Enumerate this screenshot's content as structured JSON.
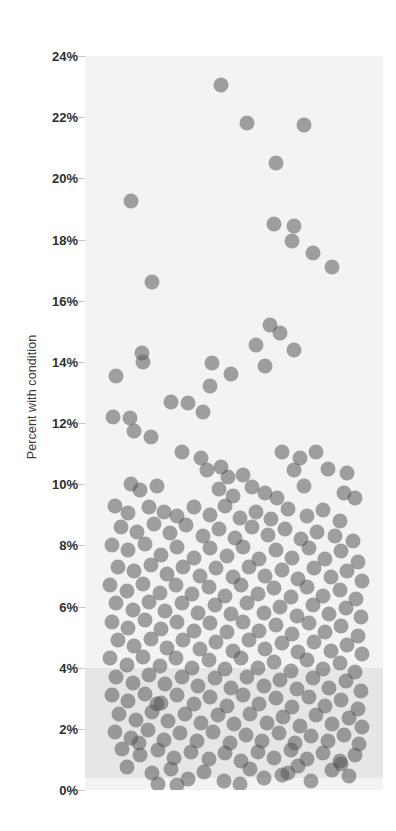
{
  "chart_data": {
    "type": "scatter",
    "title": "",
    "xlabel": "",
    "ylabel": "Percent with condition",
    "ylim": [
      0,
      24
    ],
    "xlim": [
      0,
      1
    ],
    "grid": false,
    "legend": null,
    "y_tick_labels": [
      "24%",
      "22%",
      "20%",
      "18%",
      "16%",
      "14%",
      "12%",
      "10%",
      "8%",
      "6%",
      "4%",
      "2%",
      "0%"
    ],
    "y_tick_values": [
      24,
      22,
      20,
      18,
      16,
      14,
      12,
      10,
      8,
      6,
      4,
      2,
      0
    ],
    "x_tick_labels": [],
    "marker": {
      "shape": "circle",
      "diameter_px": 15,
      "color": "#585858",
      "opacity": 0.55
    },
    "plot_background": "#f3f3f3",
    "shaded_band": {
      "color": "#e6e6e6",
      "y_from": 0.4,
      "y_to": 4.0
    },
    "points": [
      {
        "x": 0.455,
        "y": 23.05
      },
      {
        "x": 0.545,
        "y": 21.8
      },
      {
        "x": 0.735,
        "y": 21.75
      },
      {
        "x": 0.64,
        "y": 20.5
      },
      {
        "x": 0.155,
        "y": 19.25
      },
      {
        "x": 0.635,
        "y": 18.5
      },
      {
        "x": 0.7,
        "y": 18.45
      },
      {
        "x": 0.695,
        "y": 17.95
      },
      {
        "x": 0.765,
        "y": 17.55
      },
      {
        "x": 0.83,
        "y": 17.1
      },
      {
        "x": 0.225,
        "y": 16.6
      },
      {
        "x": 0.62,
        "y": 15.2
      },
      {
        "x": 0.655,
        "y": 14.95
      },
      {
        "x": 0.575,
        "y": 14.55
      },
      {
        "x": 0.7,
        "y": 14.4
      },
      {
        "x": 0.19,
        "y": 14.3
      },
      {
        "x": 0.195,
        "y": 14.0
      },
      {
        "x": 0.425,
        "y": 13.95
      },
      {
        "x": 0.49,
        "y": 13.6
      },
      {
        "x": 0.605,
        "y": 13.85
      },
      {
        "x": 0.105,
        "y": 13.55
      },
      {
        "x": 0.42,
        "y": 13.2
      },
      {
        "x": 0.29,
        "y": 12.7
      },
      {
        "x": 0.345,
        "y": 12.65
      },
      {
        "x": 0.395,
        "y": 12.35
      },
      {
        "x": 0.095,
        "y": 12.2
      },
      {
        "x": 0.15,
        "y": 12.15
      },
      {
        "x": 0.165,
        "y": 11.75
      },
      {
        "x": 0.22,
        "y": 11.55
      },
      {
        "x": 0.325,
        "y": 11.05
      },
      {
        "x": 0.39,
        "y": 10.85
      },
      {
        "x": 0.66,
        "y": 11.05
      },
      {
        "x": 0.72,
        "y": 10.85
      },
      {
        "x": 0.775,
        "y": 11.05
      },
      {
        "x": 0.41,
        "y": 10.45
      },
      {
        "x": 0.455,
        "y": 10.55
      },
      {
        "x": 0.48,
        "y": 10.25
      },
      {
        "x": 0.53,
        "y": 10.3
      },
      {
        "x": 0.7,
        "y": 10.45
      },
      {
        "x": 0.815,
        "y": 10.5
      },
      {
        "x": 0.88,
        "y": 10.35
      },
      {
        "x": 0.155,
        "y": 10.0
      },
      {
        "x": 0.185,
        "y": 9.8
      },
      {
        "x": 0.24,
        "y": 9.95
      },
      {
        "x": 0.45,
        "y": 9.85
      },
      {
        "x": 0.495,
        "y": 9.6
      },
      {
        "x": 0.56,
        "y": 9.9
      },
      {
        "x": 0.605,
        "y": 9.7
      },
      {
        "x": 0.645,
        "y": 9.55
      },
      {
        "x": 0.735,
        "y": 9.95
      },
      {
        "x": 0.87,
        "y": 9.7
      },
      {
        "x": 0.905,
        "y": 9.55
      },
      {
        "x": 0.1,
        "y": 9.3
      },
      {
        "x": 0.145,
        "y": 9.05
      },
      {
        "x": 0.215,
        "y": 9.25
      },
      {
        "x": 0.265,
        "y": 9.1
      },
      {
        "x": 0.31,
        "y": 8.95
      },
      {
        "x": 0.365,
        "y": 9.25
      },
      {
        "x": 0.42,
        "y": 9.0
      },
      {
        "x": 0.47,
        "y": 9.3
      },
      {
        "x": 0.52,
        "y": 8.9
      },
      {
        "x": 0.575,
        "y": 9.1
      },
      {
        "x": 0.625,
        "y": 8.85
      },
      {
        "x": 0.68,
        "y": 9.2
      },
      {
        "x": 0.745,
        "y": 8.95
      },
      {
        "x": 0.8,
        "y": 9.15
      },
      {
        "x": 0.855,
        "y": 8.8
      },
      {
        "x": 0.12,
        "y": 8.6
      },
      {
        "x": 0.175,
        "y": 8.45
      },
      {
        "x": 0.23,
        "y": 8.7
      },
      {
        "x": 0.285,
        "y": 8.4
      },
      {
        "x": 0.34,
        "y": 8.65
      },
      {
        "x": 0.395,
        "y": 8.3
      },
      {
        "x": 0.45,
        "y": 8.55
      },
      {
        "x": 0.505,
        "y": 8.25
      },
      {
        "x": 0.56,
        "y": 8.6
      },
      {
        "x": 0.615,
        "y": 8.35
      },
      {
        "x": 0.67,
        "y": 8.55
      },
      {
        "x": 0.725,
        "y": 8.2
      },
      {
        "x": 0.78,
        "y": 8.45
      },
      {
        "x": 0.84,
        "y": 8.3
      },
      {
        "x": 0.9,
        "y": 8.15
      },
      {
        "x": 0.09,
        "y": 8.0
      },
      {
        "x": 0.145,
        "y": 7.85
      },
      {
        "x": 0.2,
        "y": 8.05
      },
      {
        "x": 0.255,
        "y": 7.7
      },
      {
        "x": 0.31,
        "y": 7.95
      },
      {
        "x": 0.365,
        "y": 7.6
      },
      {
        "x": 0.42,
        "y": 7.9
      },
      {
        "x": 0.475,
        "y": 7.65
      },
      {
        "x": 0.53,
        "y": 7.95
      },
      {
        "x": 0.585,
        "y": 7.55
      },
      {
        "x": 0.64,
        "y": 7.85
      },
      {
        "x": 0.695,
        "y": 7.6
      },
      {
        "x": 0.75,
        "y": 7.9
      },
      {
        "x": 0.805,
        "y": 7.55
      },
      {
        "x": 0.86,
        "y": 7.8
      },
      {
        "x": 0.915,
        "y": 7.45
      },
      {
        "x": 0.11,
        "y": 7.3
      },
      {
        "x": 0.165,
        "y": 7.15
      },
      {
        "x": 0.22,
        "y": 7.35
      },
      {
        "x": 0.275,
        "y": 7.05
      },
      {
        "x": 0.33,
        "y": 7.3
      },
      {
        "x": 0.385,
        "y": 7.0
      },
      {
        "x": 0.44,
        "y": 7.25
      },
      {
        "x": 0.495,
        "y": 6.95
      },
      {
        "x": 0.55,
        "y": 7.3
      },
      {
        "x": 0.605,
        "y": 7.0
      },
      {
        "x": 0.66,
        "y": 7.2
      },
      {
        "x": 0.715,
        "y": 6.9
      },
      {
        "x": 0.77,
        "y": 7.25
      },
      {
        "x": 0.825,
        "y": 6.95
      },
      {
        "x": 0.88,
        "y": 7.15
      },
      {
        "x": 0.93,
        "y": 6.85
      },
      {
        "x": 0.085,
        "y": 6.7
      },
      {
        "x": 0.14,
        "y": 6.5
      },
      {
        "x": 0.195,
        "y": 6.75
      },
      {
        "x": 0.25,
        "y": 6.45
      },
      {
        "x": 0.305,
        "y": 6.7
      },
      {
        "x": 0.36,
        "y": 6.4
      },
      {
        "x": 0.415,
        "y": 6.65
      },
      {
        "x": 0.47,
        "y": 6.35
      },
      {
        "x": 0.525,
        "y": 6.7
      },
      {
        "x": 0.58,
        "y": 6.4
      },
      {
        "x": 0.635,
        "y": 6.6
      },
      {
        "x": 0.69,
        "y": 6.3
      },
      {
        "x": 0.745,
        "y": 6.65
      },
      {
        "x": 0.8,
        "y": 6.35
      },
      {
        "x": 0.855,
        "y": 6.55
      },
      {
        "x": 0.91,
        "y": 6.25
      },
      {
        "x": 0.105,
        "y": 6.1
      },
      {
        "x": 0.16,
        "y": 5.9
      },
      {
        "x": 0.215,
        "y": 6.15
      },
      {
        "x": 0.27,
        "y": 5.85
      },
      {
        "x": 0.325,
        "y": 6.1
      },
      {
        "x": 0.38,
        "y": 5.8
      },
      {
        "x": 0.435,
        "y": 6.05
      },
      {
        "x": 0.49,
        "y": 5.75
      },
      {
        "x": 0.545,
        "y": 6.1
      },
      {
        "x": 0.6,
        "y": 5.8
      },
      {
        "x": 0.655,
        "y": 6.0
      },
      {
        "x": 0.71,
        "y": 5.7
      },
      {
        "x": 0.765,
        "y": 6.05
      },
      {
        "x": 0.82,
        "y": 5.75
      },
      {
        "x": 0.875,
        "y": 5.95
      },
      {
        "x": 0.925,
        "y": 5.65
      },
      {
        "x": 0.09,
        "y": 5.5
      },
      {
        "x": 0.145,
        "y": 5.3
      },
      {
        "x": 0.2,
        "y": 5.55
      },
      {
        "x": 0.255,
        "y": 5.25
      },
      {
        "x": 0.31,
        "y": 5.5
      },
      {
        "x": 0.365,
        "y": 5.2
      },
      {
        "x": 0.42,
        "y": 5.45
      },
      {
        "x": 0.475,
        "y": 5.15
      },
      {
        "x": 0.53,
        "y": 5.5
      },
      {
        "x": 0.585,
        "y": 5.2
      },
      {
        "x": 0.64,
        "y": 5.4
      },
      {
        "x": 0.695,
        "y": 5.1
      },
      {
        "x": 0.75,
        "y": 5.45
      },
      {
        "x": 0.805,
        "y": 5.15
      },
      {
        "x": 0.86,
        "y": 5.35
      },
      {
        "x": 0.915,
        "y": 5.05
      },
      {
        "x": 0.11,
        "y": 4.9
      },
      {
        "x": 0.165,
        "y": 4.7
      },
      {
        "x": 0.22,
        "y": 4.95
      },
      {
        "x": 0.275,
        "y": 4.65
      },
      {
        "x": 0.33,
        "y": 4.9
      },
      {
        "x": 0.385,
        "y": 4.6
      },
      {
        "x": 0.44,
        "y": 4.85
      },
      {
        "x": 0.495,
        "y": 4.55
      },
      {
        "x": 0.55,
        "y": 4.9
      },
      {
        "x": 0.605,
        "y": 4.6
      },
      {
        "x": 0.66,
        "y": 4.8
      },
      {
        "x": 0.715,
        "y": 4.5
      },
      {
        "x": 0.77,
        "y": 4.85
      },
      {
        "x": 0.825,
        "y": 4.55
      },
      {
        "x": 0.88,
        "y": 4.75
      },
      {
        "x": 0.93,
        "y": 4.45
      },
      {
        "x": 0.085,
        "y": 4.3
      },
      {
        "x": 0.14,
        "y": 4.1
      },
      {
        "x": 0.195,
        "y": 4.35
      },
      {
        "x": 0.25,
        "y": 4.05
      },
      {
        "x": 0.305,
        "y": 4.3
      },
      {
        "x": 0.36,
        "y": 4.0
      },
      {
        "x": 0.415,
        "y": 4.25
      },
      {
        "x": 0.47,
        "y": 3.95
      },
      {
        "x": 0.525,
        "y": 4.3
      },
      {
        "x": 0.58,
        "y": 4.0
      },
      {
        "x": 0.635,
        "y": 4.2
      },
      {
        "x": 0.69,
        "y": 3.9
      },
      {
        "x": 0.745,
        "y": 4.25
      },
      {
        "x": 0.8,
        "y": 3.95
      },
      {
        "x": 0.855,
        "y": 4.15
      },
      {
        "x": 0.905,
        "y": 3.85
      },
      {
        "x": 0.105,
        "y": 3.7
      },
      {
        "x": 0.16,
        "y": 3.5
      },
      {
        "x": 0.215,
        "y": 3.75
      },
      {
        "x": 0.27,
        "y": 3.45
      },
      {
        "x": 0.325,
        "y": 3.7
      },
      {
        "x": 0.38,
        "y": 3.4
      },
      {
        "x": 0.435,
        "y": 3.65
      },
      {
        "x": 0.49,
        "y": 3.35
      },
      {
        "x": 0.545,
        "y": 3.7
      },
      {
        "x": 0.6,
        "y": 3.4
      },
      {
        "x": 0.655,
        "y": 3.6
      },
      {
        "x": 0.71,
        "y": 3.3
      },
      {
        "x": 0.765,
        "y": 3.65
      },
      {
        "x": 0.82,
        "y": 3.35
      },
      {
        "x": 0.875,
        "y": 3.55
      },
      {
        "x": 0.925,
        "y": 3.25
      },
      {
        "x": 0.09,
        "y": 3.1
      },
      {
        "x": 0.145,
        "y": 2.9
      },
      {
        "x": 0.2,
        "y": 3.15
      },
      {
        "x": 0.255,
        "y": 2.85
      },
      {
        "x": 0.31,
        "y": 3.1
      },
      {
        "x": 0.365,
        "y": 2.8
      },
      {
        "x": 0.42,
        "y": 3.05
      },
      {
        "x": 0.475,
        "y": 2.75
      },
      {
        "x": 0.53,
        "y": 3.1
      },
      {
        "x": 0.585,
        "y": 2.8
      },
      {
        "x": 0.64,
        "y": 3.0
      },
      {
        "x": 0.695,
        "y": 2.7
      },
      {
        "x": 0.75,
        "y": 3.05
      },
      {
        "x": 0.805,
        "y": 2.75
      },
      {
        "x": 0.86,
        "y": 2.95
      },
      {
        "x": 0.915,
        "y": 2.65
      },
      {
        "x": 0.115,
        "y": 2.5
      },
      {
        "x": 0.17,
        "y": 2.3
      },
      {
        "x": 0.225,
        "y": 2.55
      },
      {
        "x": 0.28,
        "y": 2.25
      },
      {
        "x": 0.335,
        "y": 2.5
      },
      {
        "x": 0.39,
        "y": 2.2
      },
      {
        "x": 0.445,
        "y": 2.45
      },
      {
        "x": 0.5,
        "y": 2.15
      },
      {
        "x": 0.555,
        "y": 2.5
      },
      {
        "x": 0.61,
        "y": 2.2
      },
      {
        "x": 0.665,
        "y": 2.4
      },
      {
        "x": 0.72,
        "y": 2.1
      },
      {
        "x": 0.775,
        "y": 2.45
      },
      {
        "x": 0.83,
        "y": 2.15
      },
      {
        "x": 0.885,
        "y": 2.35
      },
      {
        "x": 0.93,
        "y": 2.05
      },
      {
        "x": 0.1,
        "y": 1.9
      },
      {
        "x": 0.155,
        "y": 1.7
      },
      {
        "x": 0.21,
        "y": 1.95
      },
      {
        "x": 0.265,
        "y": 1.65
      },
      {
        "x": 0.32,
        "y": 1.85
      },
      {
        "x": 0.375,
        "y": 1.6
      },
      {
        "x": 0.43,
        "y": 1.9
      },
      {
        "x": 0.485,
        "y": 1.55
      },
      {
        "x": 0.54,
        "y": 1.8
      },
      {
        "x": 0.595,
        "y": 1.6
      },
      {
        "x": 0.65,
        "y": 1.85
      },
      {
        "x": 0.705,
        "y": 1.55
      },
      {
        "x": 0.76,
        "y": 1.75
      },
      {
        "x": 0.815,
        "y": 1.6
      },
      {
        "x": 0.87,
        "y": 1.8
      },
      {
        "x": 0.92,
        "y": 1.5
      },
      {
        "x": 0.125,
        "y": 1.35
      },
      {
        "x": 0.185,
        "y": 1.15
      },
      {
        "x": 0.245,
        "y": 1.3
      },
      {
        "x": 0.3,
        "y": 1.05
      },
      {
        "x": 0.355,
        "y": 1.25
      },
      {
        "x": 0.415,
        "y": 1.0
      },
      {
        "x": 0.47,
        "y": 1.2
      },
      {
        "x": 0.525,
        "y": 0.95
      },
      {
        "x": 0.58,
        "y": 1.25
      },
      {
        "x": 0.635,
        "y": 1.05
      },
      {
        "x": 0.69,
        "y": 1.3
      },
      {
        "x": 0.745,
        "y": 1.0
      },
      {
        "x": 0.8,
        "y": 1.2
      },
      {
        "x": 0.855,
        "y": 0.95
      },
      {
        "x": 0.905,
        "y": 1.15
      },
      {
        "x": 0.14,
        "y": 0.75
      },
      {
        "x": 0.225,
        "y": 0.55
      },
      {
        "x": 0.29,
        "y": 0.7
      },
      {
        "x": 0.345,
        "y": 0.35
      },
      {
        "x": 0.4,
        "y": 0.6
      },
      {
        "x": 0.465,
        "y": 0.3
      },
      {
        "x": 0.555,
        "y": 0.7
      },
      {
        "x": 0.6,
        "y": 0.4
      },
      {
        "x": 0.68,
        "y": 0.55
      },
      {
        "x": 0.76,
        "y": 0.3
      },
      {
        "x": 0.83,
        "y": 0.65
      },
      {
        "x": 0.885,
        "y": 0.45
      },
      {
        "x": 0.245,
        "y": 0.2
      },
      {
        "x": 0.31,
        "y": 0.15
      },
      {
        "x": 0.52,
        "y": 0.2
      },
      {
        "x": 0.66,
        "y": 0.5
      },
      {
        "x": 0.715,
        "y": 0.8
      },
      {
        "x": 0.18,
        "y": 1.55
      },
      {
        "x": 0.24,
        "y": 2.8
      },
      {
        "x": 0.86,
        "y": 0.85
      }
    ]
  }
}
